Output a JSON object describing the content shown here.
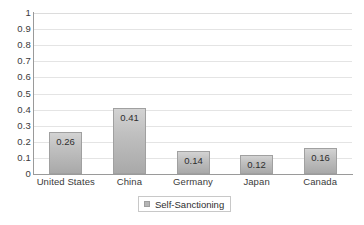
{
  "chart_data": {
    "type": "bar",
    "title": "",
    "subtitle": "",
    "xlabel": "",
    "ylabel": "",
    "categories": [
      "United States",
      "China",
      "Germany",
      "Japan",
      "Canada"
    ],
    "values": [
      0.26,
      0.41,
      0.14,
      0.12,
      0.16
    ],
    "data_labels": [
      "0.26",
      "0.41",
      "0.14",
      "0.12",
      "0.16"
    ],
    "series": [
      {
        "name": "Self-Sanctioning",
        "values": [
          0.26,
          0.41,
          0.14,
          0.12,
          0.16
        ],
        "color": "#c0c0c0"
      }
    ],
    "ylim": [
      0,
      1
    ],
    "yticks": [
      0,
      0.1,
      0.2,
      0.3,
      0.4,
      0.5,
      0.6,
      0.7,
      0.8,
      0.9,
      1
    ],
    "ytick_labels": [
      "0",
      "0.1",
      "0.2",
      "0.3",
      "0.4",
      "0.5",
      "0.6",
      "0.7",
      "0.8",
      "0.9",
      "1"
    ],
    "grid": true,
    "grid_axis": "y",
    "legend": {
      "position": "bottom",
      "entries": [
        "Self-Sanctioning"
      ],
      "swatch_color": "#b5b5b5",
      "boxed": true
    },
    "colors": {
      "bar_top": "#d3d3d3",
      "bar_bottom": "#a9a9a9",
      "bar_border": "#a0a0a0",
      "gridline": "#e4e4e4",
      "axis": "#9a9a9a",
      "text": "#3a3a3a",
      "background": "#ffffff"
    }
  }
}
